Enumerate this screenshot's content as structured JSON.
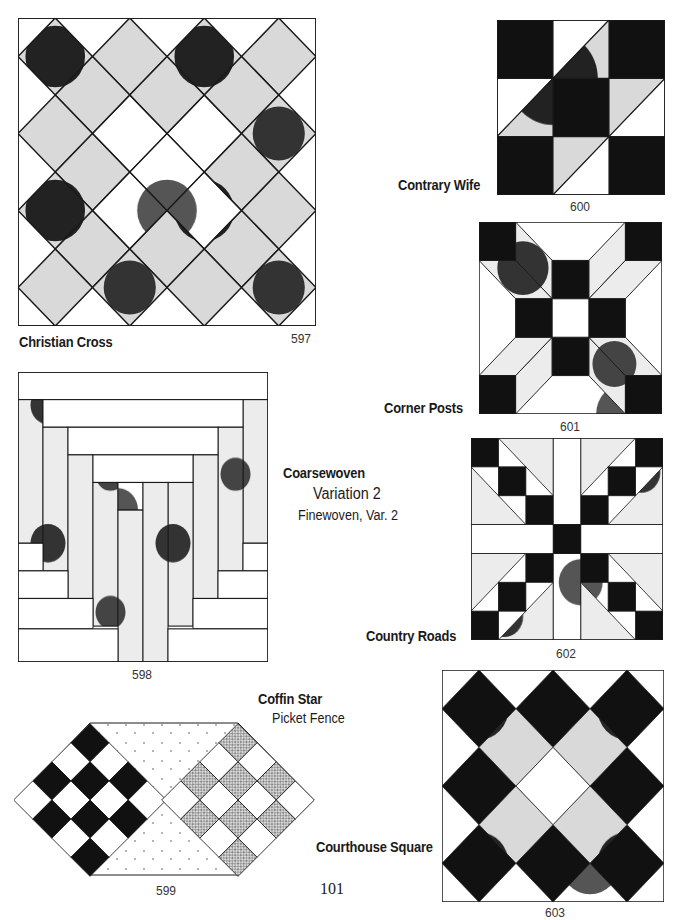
{
  "page": {
    "number": "101"
  },
  "colors": {
    "ink": "#1a1a1a",
    "paper": "#ffffff",
    "stipple_dense": "#5a5a5a",
    "stipple_light": "#c8c8c8"
  },
  "blocks": [
    {
      "id": "597",
      "number": "597",
      "name": "Christian Cross",
      "alternates": []
    },
    {
      "id": "598",
      "number": "598",
      "name": "Coarsewoven",
      "alternates": [
        "Variation 2",
        "Finewoven, Var. 2"
      ]
    },
    {
      "id": "599",
      "number": "599",
      "name": "Coffin Star",
      "alternates": [
        "Picket Fence"
      ]
    },
    {
      "id": "600",
      "number": "600",
      "name": "Contrary Wife",
      "alternates": []
    },
    {
      "id": "601",
      "number": "601",
      "name": "Corner Posts",
      "alternates": []
    },
    {
      "id": "602",
      "number": "602",
      "name": "Country Roads",
      "alternates": []
    },
    {
      "id": "603",
      "number": "603",
      "name": "Courthouse Square",
      "alternates": []
    }
  ]
}
